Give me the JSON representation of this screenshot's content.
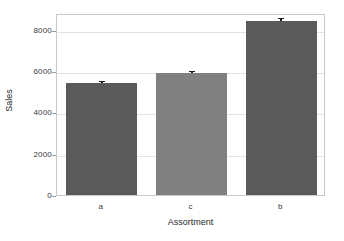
{
  "chart_data": {
    "type": "bar",
    "title": "",
    "subtitle": "",
    "xlabel": "Assortment",
    "ylabel": "Sales",
    "categories": [
      "a",
      "c",
      "b"
    ],
    "values": [
      5500,
      6000,
      8500
    ],
    "errors": [
      120,
      110,
      150
    ],
    "series": [
      {
        "name": "Sales",
        "values": [
          5500,
          6000,
          8500
        ]
      }
    ],
    "ylim": [
      0,
      8800
    ],
    "yticks": [
      0,
      2000,
      4000,
      6000,
      8000
    ],
    "ytick_labels": [
      "0",
      "2000",
      "4000",
      "6000",
      "8000"
    ],
    "xtick_labels": [
      "a",
      "c",
      "b"
    ],
    "grid": "horizontal",
    "legend": "none",
    "bar_colors": [
      "#5a5a5a",
      "#808080",
      "#5a5a5a"
    ],
    "error_bar_color": "#1b1b1b",
    "frame_color": "#c9c9c9",
    "gridline_color": "#e3e3e3",
    "background": "#ffffff"
  }
}
